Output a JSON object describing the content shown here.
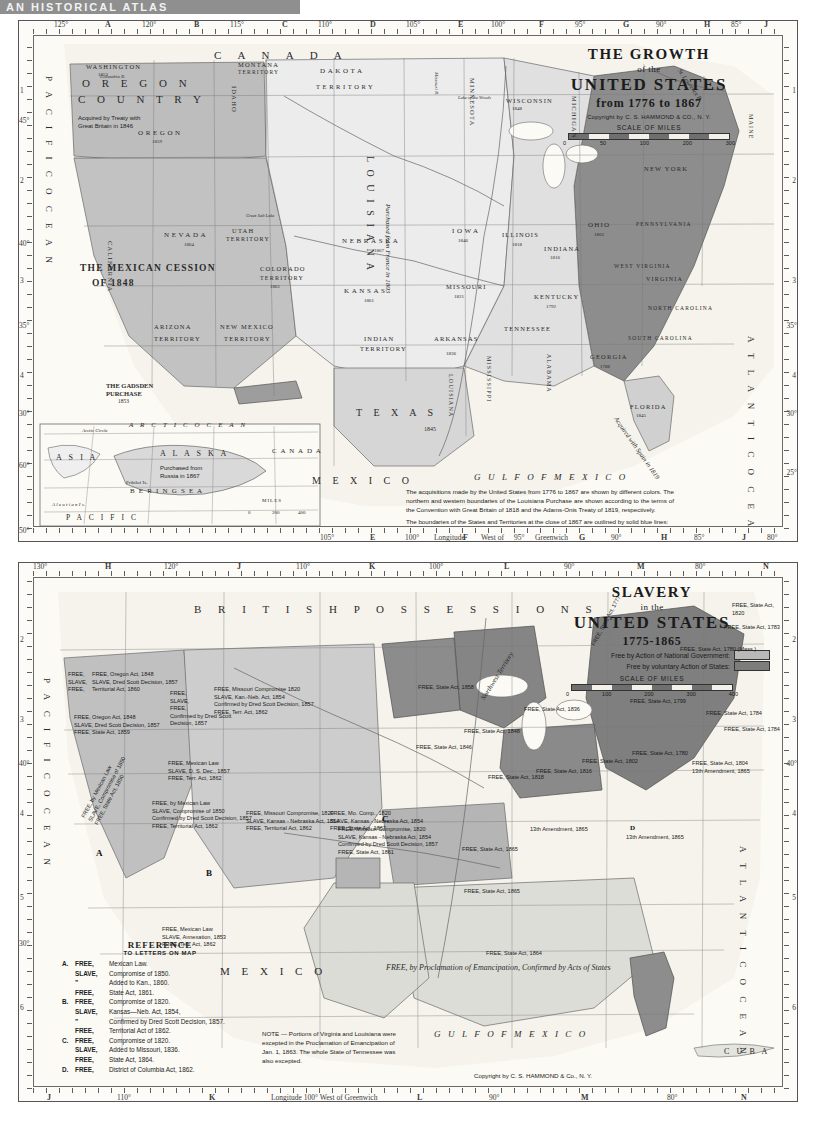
{
  "page_header": "AN HISTORICAL ATLAS",
  "map_growth": {
    "title": {
      "line1": "THE GROWTH",
      "line2": "of the",
      "line3": "UNITED STATES",
      "line4": "from 1776 to 1867",
      "copyright": "Copyright by C. S. HAMMOND & CO., N. Y.",
      "scale_title": "SCALE OF MILES",
      "scale_numbers": [
        "0",
        "50",
        "100",
        "200",
        "300"
      ]
    },
    "explanation": [
      "The acquisitions made by the United States from 1776 to 1867 are shown by different colors. The northern and western boundaries of the Louisiana Purchase are shown according to the terms of the Convention with Great Britain of 1818 and the Adams-Onis Treaty of 1819, respectively.",
      "The boundaries of the States and Territories at the close of 1867 are outlined by solid blue lines:",
      "The Capitals of the States and Territories in 1867 are shown on map by: ⊙"
    ],
    "top_coords": [
      "125°",
      "A",
      "120°",
      "B",
      "115°",
      "C",
      "110°",
      "D",
      "105°",
      "E",
      "100°",
      "F",
      "95°",
      "G",
      "90°",
      "H",
      "85°",
      "J",
      "80°",
      "K",
      "75°",
      "L",
      "70°",
      "M"
    ],
    "bottom_coords": [
      "105°",
      "E",
      "100°",
      "Longitude",
      "F",
      "West of",
      "95°",
      "Greenwich",
      "G",
      "90°",
      "H",
      "85°",
      "J",
      "80°",
      "K"
    ],
    "left_coords": [
      "1",
      "45°",
      "2",
      "40°",
      "3",
      "35°",
      "4",
      "30°",
      "60°",
      "50°"
    ],
    "right_coords": [
      "1",
      "2",
      "3",
      "4",
      "35°",
      "30°",
      "25°"
    ],
    "oceans": [
      {
        "name": "PACIFIC OCEAN",
        "text": "P A C I F I C   O C E A N"
      },
      {
        "name": "ATLANTIC OCEAN",
        "text": "A T L A N T I C   O C E A N"
      },
      {
        "name": "GULF OF MEXICO",
        "text": "G U L F   O F   M E X I C O"
      },
      {
        "name": "ARCTIC OCEAN",
        "text": "A R C T I C   O C E A N"
      },
      {
        "name": "BERING SEA",
        "text": "B E R I N G  S E A"
      },
      {
        "name": "PACIFIC",
        "text": "P A C I F I C"
      }
    ],
    "regions": [
      {
        "name": "CANADA",
        "label": "C A N A D A"
      },
      {
        "name": "MEXICO",
        "label": "M E X I C O"
      },
      {
        "name": "ASIA",
        "label": "A S I A"
      },
      {
        "name": "ALASKA",
        "label": "A L A S K A"
      },
      {
        "name": "CANADA-inset",
        "label": "C A N A D A"
      }
    ],
    "acquisitions": [
      {
        "name": "oregon-country",
        "line1": "O R E G O N",
        "line2": "C O U N T R Y",
        "note": "Acquired by Treaty with\nGreat Britain in 1846"
      },
      {
        "name": "mexican-cession",
        "line1": "THE MEXICAN CESSION",
        "line2": "OF 1848"
      },
      {
        "name": "louisiana-purchase",
        "label": "L O U I S I A N A",
        "note": "Purchased from France in 1803"
      },
      {
        "name": "gadsden-purchase",
        "line1": "THE GADSDEN",
        "line2": "PURCHASE",
        "year": "1853"
      },
      {
        "name": "alaska-purchase",
        "note": "Purchased from\nRussia in 1867"
      },
      {
        "name": "florida-acquisition",
        "note": "Acquired with Spain in 1819"
      },
      {
        "name": "texas-annexation",
        "label": "T E X A S",
        "year": "1845"
      }
    ],
    "states": [
      {
        "label": "WASHINGTON",
        "year": "1853"
      },
      {
        "label": "OREGON",
        "year": "1859"
      },
      {
        "label": "IDAHO",
        "year": ""
      },
      {
        "label": "MONTANA",
        "sub": "TERRITORY",
        "year": "1864"
      },
      {
        "label": "DAKOTA",
        "sub": "TERRITORY",
        "year": "1861"
      },
      {
        "label": "MINNESOTA",
        "year": "1858"
      },
      {
        "label": "WISCONSIN",
        "year": "1848"
      },
      {
        "label": "MICHIGAN",
        "year": "1837"
      },
      {
        "label": "NEVADA",
        "year": "1864"
      },
      {
        "label": "UTAH",
        "sub": "TERRITORY",
        "year": "1850"
      },
      {
        "label": "CALIFORNIA",
        "year": "1850"
      },
      {
        "label": "COLORADO",
        "sub": "TERRITORY",
        "year": "1861"
      },
      {
        "label": "NEBRASKA",
        "year": "1867"
      },
      {
        "label": "IOWA",
        "year": "1846"
      },
      {
        "label": "ILLINOIS",
        "year": "1818"
      },
      {
        "label": "INDIANA",
        "year": "1816"
      },
      {
        "label": "OHIO",
        "year": "1803"
      },
      {
        "label": "KANSAS",
        "year": "1861"
      },
      {
        "label": "MISSOURI",
        "year": "1821"
      },
      {
        "label": "KENTUCKY",
        "year": "1792"
      },
      {
        "label": "ARIZONA",
        "sub": "TERRITORY",
        "year": "1863"
      },
      {
        "label": "NEW MEXICO",
        "sub": "TERRITORY",
        "year": "1850"
      },
      {
        "label": "INDIAN",
        "sub": "TERRITORY"
      },
      {
        "label": "ARKANSAS",
        "year": "1836"
      },
      {
        "label": "TENNESSEE",
        "year": "1796"
      },
      {
        "label": "MISSISSIPPI",
        "year": "1817"
      },
      {
        "label": "ALABAMA",
        "year": "1819"
      },
      {
        "label": "LOUISIANA",
        "year": "1812"
      },
      {
        "label": "FLORIDA",
        "year": "1845"
      },
      {
        "label": "GEORGIA",
        "year": "1788"
      },
      {
        "label": "SOUTH CAROLINA",
        "year": "1788"
      },
      {
        "label": "NORTH CAROLINA",
        "year": "1789"
      },
      {
        "label": "VIRGINIA",
        "year": "1788"
      },
      {
        "label": "WEST VIRGINIA",
        "year": "1863"
      },
      {
        "label": "PENNSYLVANIA",
        "year": "1787"
      },
      {
        "label": "NEW YORK",
        "year": "1788"
      },
      {
        "label": "MAINE",
        "year": "1820"
      }
    ],
    "cities": [
      "Olympia",
      "Salem",
      "Sacramento",
      "Carson City",
      "Great Salt Lake City",
      "Virginia City",
      "Helena",
      "Yankton",
      "Lincoln",
      "Topeka",
      "Golden",
      "Santa Fe",
      "Tucson",
      "Austin",
      "Little Rock",
      "Jefferson City",
      "Des Moines",
      "Springfield",
      "Indianapolis",
      "Columbus",
      "Frankfort",
      "Nashville",
      "Jackson",
      "Montgomery",
      "Tallahassee",
      "Milledgeville",
      "Columbia",
      "Raleigh",
      "Richmond",
      "St. Paul",
      "Madison",
      "Shreveport"
    ],
    "rivers": [
      "Columbia R.",
      "Snake R.",
      "Missouri R.",
      "Platte R.",
      "Arkansas R.",
      "Red R.",
      "Mississippi R.",
      "Rio Grande",
      "Ohio R.",
      "St. Lawrence R.",
      "Yellowstone"
    ],
    "lakes": [
      "Lake of the Woods",
      "Great Salt Lake"
    ],
    "inset": {
      "arctic_circle": "Arctic Circle",
      "aleutian": "A l e u t i a n   I s.",
      "pribilof": "Pribilof Is.",
      "scale_title": "MILES",
      "scale_numbers": [
        "0",
        "200",
        "400"
      ]
    }
  },
  "map_slavery": {
    "title": {
      "line1": "SLAVERY",
      "line2": "in the",
      "line3": "UNITED STATES",
      "line4": "1775-1865",
      "legend": [
        {
          "label": "Free by Action of National Government:",
          "swatch": "#b9b9b9"
        },
        {
          "label": "Free by voluntary Action of States:",
          "swatch": "#7d7d7d"
        }
      ],
      "scale_title": "SCALE OF MILES",
      "scale_numbers": [
        "0",
        "100",
        "200",
        "300",
        "400"
      ],
      "copyright": "Copyright by C. S. HAMMOND & Co., N. Y."
    },
    "top_coords": [
      "130°",
      "H",
      "120°",
      "J",
      "110°",
      "K",
      "100°",
      "L",
      "90°",
      "M",
      "80°",
      "N",
      "70°",
      "O"
    ],
    "bottom_coords": [
      "J",
      "110°",
      "K",
      "Longitude 100° West of Greenwich",
      "L",
      "90°",
      "M",
      "80°",
      "N"
    ],
    "left_coords": [
      "2",
      "3",
      "40°",
      "4",
      "5",
      "30°",
      "6"
    ],
    "right_coords": [
      "2",
      "3",
      "40°",
      "4",
      "5",
      "6"
    ],
    "oceans": [
      {
        "name": "PACIFIC OCEAN",
        "text": "P A C I F I C   O C E A N"
      },
      {
        "name": "ATLANTIC OCEAN",
        "text": "A T L A N T I C   O C E A N"
      },
      {
        "name": "GULF OF MEXICO",
        "text": "G U L F   O F   M E X I C O"
      }
    ],
    "regions": [
      {
        "name": "BRITISH POSSESSIONS",
        "label": "B R I T I S H   P O S S E S S I O N S"
      },
      {
        "name": "MEXICO",
        "label": "M E X I C O"
      },
      {
        "name": "CUBA",
        "label": "C U B A"
      }
    ],
    "note": "NOTE — Portions of Virginia and Louisiana were excepted in the Proclamation of Emancipation of Jan. 1, 1863. The whole State of Tennessee was also excepted.",
    "proclamation_label": "FREE, by Proclamation of Emancipation,\nConfirmed by Acts of States",
    "northwest_territory": "Northwest Territory",
    "reference": {
      "title": "REFERENCE",
      "subtitle": "TO LETTERS ON MAP",
      "lines": [
        {
          "letter": "A.",
          "status": "FREE,",
          "text": "Mexican Law."
        },
        {
          "letter": "",
          "status": "SLAVE,",
          "text": "Compromise of 1850."
        },
        {
          "letter": "",
          "status": "”",
          "text": "Added to Kan., 1860."
        },
        {
          "letter": "",
          "status": "FREE,",
          "text": "State Act, 1861."
        },
        {
          "letter": "B.",
          "status": "FREE,",
          "text": "Compromise of 1820."
        },
        {
          "letter": "",
          "status": "SLAVE,",
          "text": "Kansas—Neb. Act, 1854,"
        },
        {
          "letter": "",
          "status": "”",
          "text": "Confirmed by Dred Scott Decision, 1857."
        },
        {
          "letter": "",
          "status": "FREE,",
          "text": "Territorial Act of 1862."
        },
        {
          "letter": "C.",
          "status": "FREE,",
          "text": "Compromise of 1820."
        },
        {
          "letter": "",
          "status": "SLAVE,",
          "text": "Added to Missouri, 1836."
        },
        {
          "letter": "",
          "status": "FREE,",
          "text": "State Act, 1864."
        },
        {
          "letter": "D.",
          "status": "FREE,",
          "text": "District of Columbia Act, 1862."
        }
      ]
    },
    "annotations": [
      {
        "name": "oregon",
        "text": "FREE, Oregon Act, 1848\nSLAVE, Dred Scott Decision, 1857\nTerritorial Act, 1860"
      },
      {
        "name": "washington",
        "text": "FREE,\nSLAVE,\nFREE,"
      },
      {
        "name": "california",
        "text": "FREE, Oregon Act, 1848\nSLAVE, Dred Scott Decision, 1857\nFREE, State Act, 1859"
      },
      {
        "name": "california-mexican",
        "text": "FREE, by Mexican Law\nSLAVE, Compromise of 1850\nFREE, State Act, 1850"
      },
      {
        "name": "dakota",
        "text": "FREE, Missouri Compromise 1820\nSLAVE, Kan.-Neb. Act, 1854\nConfirmed by Dred Scott Decision, 1857\nFREE, Terr. Act, 1862"
      },
      {
        "name": "montana",
        "text": "FREE,\nSLAVE,\nFREE,\nConfirmed by Dred Scott\nDecision, 1857"
      },
      {
        "name": "nebraska",
        "text": "FREE, Mo. Comp., 1820\nSLAVE, Kansas - Nebraska Act, 1854\nFREE, State Act, 1867"
      },
      {
        "name": "wyoming",
        "text": "FREE, Mexican Law\nSLAVE, D. S. Dec., 1857\nFREE, Terr. Act, 1862"
      },
      {
        "name": "colorado",
        "text": "FREE, Missouri Compromise, 1820\nSLAVE, Kansas - Nebraska Act, 1854\nFREE, Territorial Act, 1862"
      },
      {
        "name": "kansas",
        "text": "FREE, Missouri Compromise, 1820\nSLAVE, Kansas - Nebraska Act, 1854\nConfirmed by Dred Scott Decision, 1857\nFREE, State Act, 1861"
      },
      {
        "name": "new-mexico",
        "text": "FREE, Mexican Law\nSLAVE, Annexation, 1853\nFREE, Terr. Act, 1862"
      },
      {
        "name": "utah",
        "text": "FREE, by Mexican Law\nSLAVE, Compromise of 1850\nConfirmed by Dred Scott Decision, 1857\nFREE, Territorial Act, 1862"
      },
      {
        "name": "minnesota",
        "text": "FREE, State Act, 1858"
      },
      {
        "name": "iowa",
        "text": "FREE, State Act, 1846"
      },
      {
        "name": "wisconsin",
        "text": "FREE, State Act, 1848"
      },
      {
        "name": "missouri",
        "text": "FREE, State Act, 1865"
      },
      {
        "name": "arkansas",
        "text": "FREE, State Act, 1865"
      },
      {
        "name": "illinois",
        "text": "FREE, State Act, 1818"
      },
      {
        "name": "indiana",
        "text": "FREE, State Act, 1816"
      },
      {
        "name": "ohio",
        "text": "FREE, State Act, 1802"
      },
      {
        "name": "michigan",
        "text": "FREE, State Act, 1836"
      },
      {
        "name": "texas",
        "text": "FREE, State Act, 1864"
      },
      {
        "name": "kentucky",
        "text": "13th Amendment, 1865"
      },
      {
        "name": "delaware",
        "text": "13th Amendment, 1865"
      },
      {
        "name": "new-york",
        "text": "FREE, State Act, 1799"
      },
      {
        "name": "pennsylvania",
        "text": "FREE, State Act, 1780"
      },
      {
        "name": "new-jersey",
        "text": "FREE, State Act, 1804\n13th Amendment, 1865"
      },
      {
        "name": "massachusetts",
        "text": "FREE, State Act, 1780 (Mass.)"
      },
      {
        "name": "connecticut",
        "text": "FREE, State Act, 1784"
      },
      {
        "name": "rhode-island",
        "text": "FREE, State Act, 1784"
      },
      {
        "name": "new-hampshire",
        "text": "FREE, State Act, 1783"
      },
      {
        "name": "vermont",
        "text": "FREE, State Act, 1777"
      },
      {
        "name": "maine",
        "text": "FREE, State Act, 1820"
      }
    ],
    "map_letters": [
      "A",
      "B",
      "C",
      "D"
    ],
    "rivers": [
      "Columbia R.",
      "Snake R.",
      "Yellowstone",
      "Missouri",
      "Platte",
      "Red R.",
      "Arkansas"
    ]
  }
}
